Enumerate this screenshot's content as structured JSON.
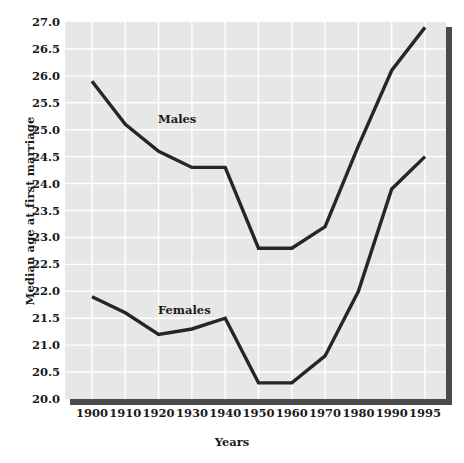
{
  "chart_data": {
    "type": "line",
    "title": "",
    "xlabel": "Years",
    "ylabel": "Median age at first marriage",
    "categories": [
      "1900",
      "1910",
      "1920",
      "1930",
      "1940",
      "1950",
      "1960",
      "1970",
      "1980",
      "1990",
      "1995"
    ],
    "series": [
      {
        "name": "Males",
        "values": [
          25.9,
          25.1,
          24.6,
          24.3,
          24.3,
          22.8,
          22.8,
          23.2,
          24.7,
          26.1,
          26.9
        ]
      },
      {
        "name": "Females",
        "values": [
          21.9,
          21.6,
          21.2,
          21.3,
          21.5,
          20.3,
          20.3,
          20.8,
          22.0,
          23.9,
          24.5
        ]
      }
    ],
    "ylim": [
      20.0,
      27.0
    ],
    "ytick_labels": [
      "20.0",
      "20.5",
      "21.0",
      "21.5",
      "22.0",
      "22.5",
      "23.0",
      "23.5",
      "24.0",
      "24.5",
      "25.0",
      "25.5",
      "26.0",
      "26.5",
      "27.0"
    ],
    "ytick_values": [
      20.0,
      20.5,
      21.0,
      21.5,
      22.0,
      22.5,
      23.0,
      23.5,
      24.0,
      24.5,
      25.0,
      25.5,
      26.0,
      26.5,
      27.0
    ],
    "grid": true,
    "legend_position": "inline-annotations",
    "annotations": [
      {
        "text": "Males",
        "series": "Males"
      },
      {
        "text": "Females",
        "series": "Females"
      }
    ],
    "colors": {
      "plot_background": "#e7e7e7",
      "gridline": "#ffffff",
      "line": "#262626",
      "shadow": "#4a4a4a",
      "text": "#1a1a1a"
    }
  }
}
